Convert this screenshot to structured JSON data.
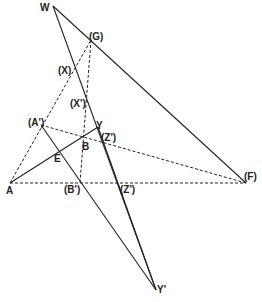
{
  "diagram": {
    "points": {
      "W": {
        "label": "W",
        "x": 53,
        "y": 6,
        "lx": 40,
        "ly": 11
      },
      "G": {
        "label": "(G)",
        "x": 91,
        "y": 40,
        "lx": 89,
        "ly": 40
      },
      "X": {
        "label": "(X)",
        "x": 74,
        "y": 70,
        "lx": 58,
        "ly": 74
      },
      "Xp": {
        "label": "(X')",
        "x": 87,
        "y": 100,
        "lx": 70,
        "ly": 107
      },
      "Ap": {
        "label": "(A')",
        "x": 41,
        "y": 125,
        "lx": 28,
        "ly": 126
      },
      "Y": {
        "label": "Y",
        "x": 98,
        "y": 127,
        "lx": 96,
        "ly": 129
      },
      "B": {
        "label": "B",
        "x": 82,
        "y": 139,
        "lx": 82,
        "ly": 150
      },
      "Z": {
        "label": "(Z')",
        "x": 102,
        "y": 137,
        "lx": 101,
        "ly": 141
      },
      "E": {
        "label": "E",
        "x": 58,
        "y": 150,
        "lx": 54,
        "ly": 162
      },
      "A": {
        "label": "A",
        "x": 10,
        "y": 183,
        "lx": 6,
        "ly": 194
      },
      "Bp": {
        "label": "(B')",
        "x": 80,
        "y": 183,
        "lx": 64,
        "ly": 193
      },
      "Zp": {
        "label": "(Z')",
        "x": 122,
        "y": 183,
        "lx": 120,
        "ly": 193
      },
      "F": {
        "label": "(F)",
        "x": 246,
        "y": 183,
        "lx": 244,
        "ly": 180
      },
      "Yp": {
        "label": "Y'",
        "x": 156,
        "y": 290,
        "lx": 157,
        "ly": 293
      }
    },
    "solid_lines": [
      [
        "W",
        "F"
      ],
      [
        "W",
        "Yp"
      ],
      [
        "A",
        "Y"
      ],
      [
        "Ap",
        "Yp"
      ],
      [
        "Y",
        "Yp"
      ]
    ],
    "dashed_lines": [
      [
        "A",
        "G"
      ],
      [
        "G",
        "Bp"
      ],
      [
        "Ap",
        "F"
      ],
      [
        "A",
        "F"
      ]
    ]
  }
}
